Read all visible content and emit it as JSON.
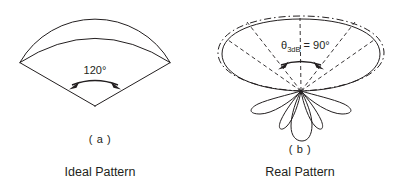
{
  "figure": {
    "panels": [
      {
        "id": "a",
        "caption_letter": "( a )",
        "caption_name": "Ideal Pattern",
        "angle_label": "120°",
        "shape": "ideal-sector-beam"
      },
      {
        "id": "b",
        "caption_letter": "( b )",
        "caption_name": "Real Pattern",
        "theta_symbol": "θ",
        "theta_subscript": "3dB",
        "theta_equals": " = 90°",
        "theta_label_full": "θ3dB = 90°",
        "shape": "real-lobed-beam"
      }
    ],
    "colors": {
      "ink": "#231f20",
      "background": "#ffffff"
    },
    "line_styles": {
      "main_outline": "solid",
      "ideal_overlay": "dash-dot",
      "beam_edges": "dashed",
      "angle_arc": "solid-double-arrow"
    }
  }
}
